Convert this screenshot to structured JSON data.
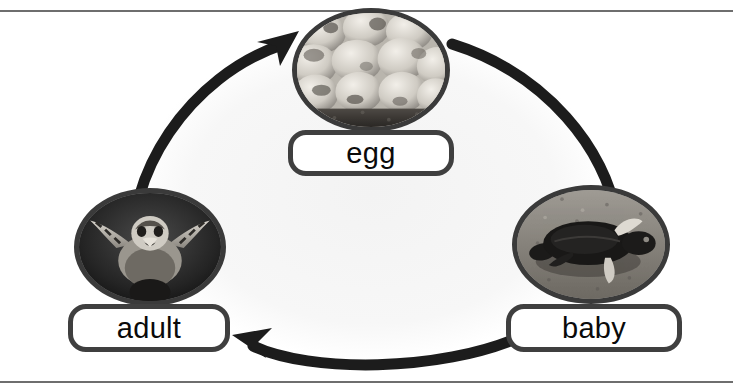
{
  "diagram": {
    "title_visible": false,
    "style": "grayscale photo life-cycle wheel",
    "direction": "clockwise",
    "colors": {
      "arrow": "#1c1c1c",
      "outline": "#3a3a3a",
      "plate_fill": "#ffffff",
      "rule": "#6e6e6e",
      "background": "#ffffff"
    },
    "nodes": [
      {
        "id": "egg",
        "label": "egg",
        "position": "top-center",
        "photo_name": "turtle-eggs-photo",
        "photo_alt": "cluster of round sea turtle eggs resting on sand"
      },
      {
        "id": "adult",
        "label": "adult",
        "position": "bottom-left",
        "photo_name": "adult-sea-turtle-photo",
        "photo_alt": "adult sea turtle swimming toward viewer in dark water"
      },
      {
        "id": "baby",
        "label": "baby",
        "position": "bottom-right",
        "photo_name": "baby-sea-turtle-photo",
        "photo_alt": "baby sea turtle hatchling crawling across sand"
      }
    ],
    "arrows": [
      {
        "id": "adult-to-egg",
        "from": "adult",
        "to": "egg",
        "name": "arrow-adult-to-egg"
      },
      {
        "id": "egg-to-baby",
        "from": "egg",
        "to": "baby",
        "name": "arrow-egg-to-baby"
      },
      {
        "id": "baby-to-adult",
        "from": "baby",
        "to": "adult",
        "name": "arrow-baby-to-adult"
      }
    ],
    "rules": [
      {
        "id": "top",
        "name": "page-rule-top"
      },
      {
        "id": "bottom",
        "name": "page-rule-bottom"
      }
    ]
  }
}
